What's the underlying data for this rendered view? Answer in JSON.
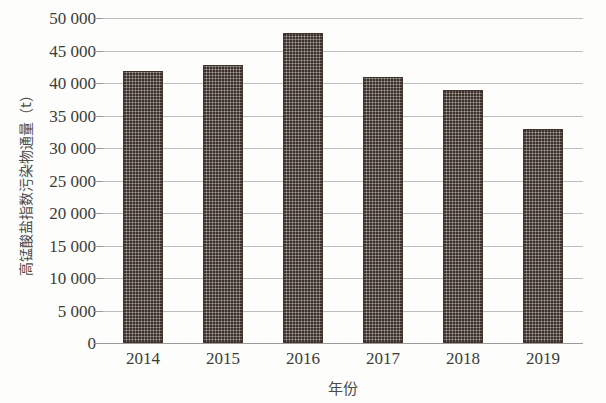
{
  "chart_data": {
    "type": "bar",
    "title": "",
    "subtitle": "",
    "xlabel": "年份",
    "ylabel": "高锰酸盐指数污染物通量（t）",
    "categories": [
      "2014",
      "2015",
      "2016",
      "2017",
      "2018",
      "2019"
    ],
    "values": [
      41800,
      42800,
      47700,
      41000,
      39000,
      33000
    ],
    "series": [
      {
        "name": "高锰酸盐指数污染物通量",
        "values": [
          41800,
          42800,
          47700,
          41000,
          39000,
          33000
        ]
      }
    ],
    "ylim": [
      0,
      50000
    ],
    "ytick_values": [
      0,
      5000,
      10000,
      15000,
      20000,
      25000,
      30000,
      35000,
      40000,
      45000,
      50000
    ],
    "ytick_labels": [
      "0",
      "5 000",
      "10 000",
      "15 000",
      "20 000",
      "25 000",
      "30 000",
      "35 000",
      "40 000",
      "45 000",
      "50 000"
    ],
    "grid": true,
    "grid_axis": "y",
    "legend": false,
    "legend_position": "none",
    "bar_color": "#3b3029",
    "bar_pattern": "checkered-dots",
    "gridline_color": "#bdbdbd",
    "axis_color": "#9a9a9a",
    "text_color": "#3b3b39",
    "background_color": "#fdfdfc",
    "annotations": []
  }
}
